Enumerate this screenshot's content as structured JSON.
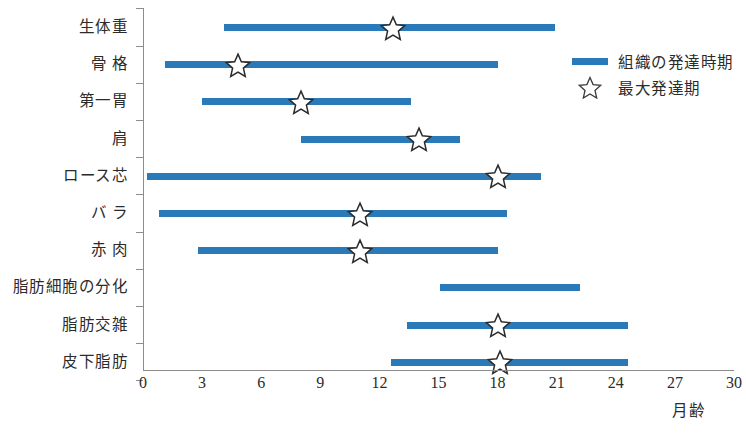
{
  "chart_data": {
    "type": "bar",
    "title": "",
    "xlabel": "月齢",
    "ylabel": "",
    "xlim": [
      0,
      30
    ],
    "xticks": [
      0,
      3,
      6,
      9,
      12,
      15,
      18,
      21,
      24,
      27,
      30
    ],
    "grid": false,
    "legend_position": "top-right",
    "categories": [
      "生体重",
      "骨格",
      "第一胃",
      "肩",
      "ロース芯",
      "バラ",
      "赤肉",
      "脂肪細胞の分化",
      "脂肪交雑",
      "皮下脂肪"
    ],
    "series": [
      {
        "name": "組織の発達時期",
        "type": "range-bar",
        "color": "#2a7ab9",
        "ranges": [
          [
            4.1,
            20.9
          ],
          [
            1.1,
            18.0
          ],
          [
            3.0,
            13.6
          ],
          [
            8.0,
            16.1
          ],
          [
            0.2,
            20.2
          ],
          [
            0.8,
            18.5
          ],
          [
            2.8,
            18.0
          ],
          [
            15.1,
            22.2
          ],
          [
            13.4,
            24.6
          ],
          [
            12.6,
            24.6
          ]
        ]
      },
      {
        "name": "最大発達期",
        "type": "marker-star",
        "color": "#ffffff",
        "values": [
          12.7,
          4.8,
          8.0,
          14.0,
          18.0,
          11.0,
          11.0,
          null,
          18.0,
          18.1
        ]
      }
    ]
  },
  "axis": {
    "x_tick_labels": [
      "0",
      "3",
      "6",
      "9",
      "12",
      "15",
      "18",
      "21",
      "24",
      "27",
      "30"
    ],
    "x_axis_title": "月齢"
  },
  "categories": [
    {
      "label": "生体重",
      "spaced": false
    },
    {
      "label": "骨 格",
      "spaced": false
    },
    {
      "label": "第一胃",
      "spaced": false
    },
    {
      "label": "肩",
      "spaced": false
    },
    {
      "label": "ロース芯",
      "spaced": false
    },
    {
      "label": "バ ラ",
      "spaced": false
    },
    {
      "label": "赤 肉",
      "spaced": false
    },
    {
      "label": "脂肪細胞の分化",
      "spaced": false
    },
    {
      "label": "脂肪交雑",
      "spaced": false
    },
    {
      "label": "皮下脂肪",
      "spaced": false
    }
  ],
  "legend": {
    "items": [
      {
        "icon": "bar-swatch",
        "label": "組織の発達時期"
      },
      {
        "icon": "star-outline-icon",
        "label": "最大発達期"
      }
    ]
  }
}
